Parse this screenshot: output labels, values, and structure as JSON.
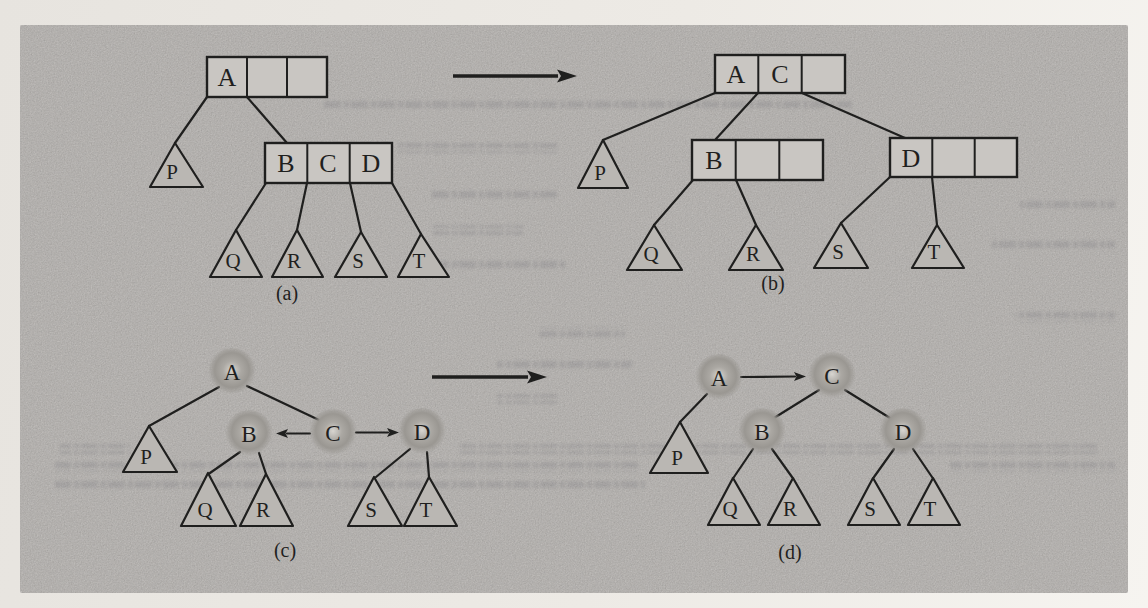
{
  "figure": {
    "type": "textbook-diagram",
    "topic": "B-tree node split shown in node form (a,b) and pointer form (c,d)",
    "colors": {
      "paper": "#efece7",
      "panel": "#b7b4b1",
      "ink": "#1f1f1e",
      "cell_fill": "#c9c6c2",
      "ball_dark": "#9a9792",
      "ball_light": "#d8d5d0"
    },
    "diagrams": {
      "a": {
        "caption": "(a)",
        "root_keys": [
          "A",
          "",
          ""
        ],
        "child_keys": [
          "B",
          "C",
          "D"
        ],
        "leaves": {
          "p": "P",
          "q": "Q",
          "r": "R",
          "s": "S",
          "t": "T"
        }
      },
      "b": {
        "caption": "(b)",
        "root_keys": [
          "A",
          "C",
          ""
        ],
        "left_keys": [
          "B",
          "",
          ""
        ],
        "right_keys": [
          "D",
          "",
          ""
        ],
        "leaves": {
          "p": "P",
          "q": "Q",
          "r": "R",
          "s": "S",
          "t": "T"
        }
      },
      "c": {
        "caption": "(c)",
        "nodes": {
          "a": "A",
          "b": "B",
          "c": "C",
          "d": "D"
        },
        "leaves": {
          "p": "P",
          "q": "Q",
          "r": "R",
          "s": "S",
          "t": "T"
        }
      },
      "d": {
        "caption": "(d)",
        "nodes": {
          "a": "A",
          "b": "B",
          "c": "C",
          "d": "D"
        },
        "leaves": {
          "p": "P",
          "q": "Q",
          "r": "R",
          "s": "S",
          "t": "T"
        }
      }
    }
  }
}
